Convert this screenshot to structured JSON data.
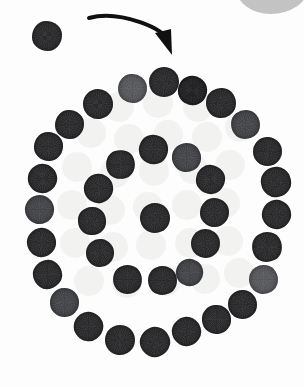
{
  "scene": {
    "title": "Spiral arrangement of dark discs",
    "width": 304,
    "height": 387,
    "background_color": "#fdfdfd",
    "surface_pattern_color": "#f2f2f1"
  },
  "annotation": {
    "arrow": {
      "name": "curved-direction-arrow",
      "color": "#101010",
      "start_x": 89,
      "start_y": 18,
      "end_x": 172,
      "end_y": 55,
      "stroke_width": 4,
      "curve": "clockwise-arc-right-down"
    }
  },
  "corner_blob": {
    "name": "grey-corner-shape",
    "color": "#b9b9b9",
    "x": 236,
    "y": -16,
    "width": 72,
    "height": 30
  },
  "legend": {
    "disc_dark_color": "#232326",
    "disc_base_color": "#2c2c2e",
    "disc_mid_color": "#46474b",
    "disc_light_color": "#5a5b5f"
  },
  "counts": {
    "outer_ring": 26,
    "inner_ring": 13,
    "center": 1,
    "stray": 1,
    "total_discs": 41,
    "background_dots": 28
  },
  "background_dots": [
    {
      "x": 104,
      "y": 92,
      "d": 30
    },
    {
      "x": 143,
      "y": 88,
      "d": 30
    },
    {
      "x": 183,
      "y": 92,
      "d": 30
    },
    {
      "x": 76,
      "y": 118,
      "d": 30
    },
    {
      "x": 114,
      "y": 124,
      "d": 30
    },
    {
      "x": 153,
      "y": 120,
      "d": 30
    },
    {
      "x": 192,
      "y": 122,
      "d": 30
    },
    {
      "x": 225,
      "y": 112,
      "d": 30
    },
    {
      "x": 62,
      "y": 152,
      "d": 30
    },
    {
      "x": 100,
      "y": 158,
      "d": 30
    },
    {
      "x": 139,
      "y": 156,
      "d": 30
    },
    {
      "x": 178,
      "y": 154,
      "d": 30
    },
    {
      "x": 215,
      "y": 150,
      "d": 30
    },
    {
      "x": 57,
      "y": 190,
      "d": 30
    },
    {
      "x": 95,
      "y": 195,
      "d": 30
    },
    {
      "x": 133,
      "y": 192,
      "d": 30
    },
    {
      "x": 172,
      "y": 190,
      "d": 30
    },
    {
      "x": 210,
      "y": 188,
      "d": 30
    },
    {
      "x": 60,
      "y": 228,
      "d": 30
    },
    {
      "x": 98,
      "y": 232,
      "d": 30
    },
    {
      "x": 136,
      "y": 230,
      "d": 30
    },
    {
      "x": 175,
      "y": 228,
      "d": 30
    },
    {
      "x": 213,
      "y": 226,
      "d": 30
    },
    {
      "x": 74,
      "y": 266,
      "d": 30
    },
    {
      "x": 112,
      "y": 268,
      "d": 30
    },
    {
      "x": 151,
      "y": 266,
      "d": 30
    },
    {
      "x": 190,
      "y": 264,
      "d": 30
    },
    {
      "x": 224,
      "y": 258,
      "d": 30
    }
  ],
  "discs": [
    {
      "x": 32,
      "y": 21,
      "d": 30,
      "tone": "base",
      "group": "stray"
    },
    {
      "x": 118,
      "y": 74,
      "d": 29,
      "tone": "light",
      "group": "outer"
    },
    {
      "x": 149,
      "y": 67,
      "d": 30,
      "tone": "base",
      "group": "outer"
    },
    {
      "x": 178,
      "y": 76,
      "d": 29,
      "tone": "dark",
      "group": "outer"
    },
    {
      "x": 206,
      "y": 88,
      "d": 30,
      "tone": "base",
      "group": "outer"
    },
    {
      "x": 231,
      "y": 110,
      "d": 29,
      "tone": "mid",
      "group": "outer"
    },
    {
      "x": 253,
      "y": 137,
      "d": 29,
      "tone": "base",
      "group": "outer"
    },
    {
      "x": 261,
      "y": 167,
      "d": 30,
      "tone": "base",
      "group": "outer"
    },
    {
      "x": 262,
      "y": 200,
      "d": 29,
      "tone": "base",
      "group": "outer"
    },
    {
      "x": 252,
      "y": 232,
      "d": 30,
      "tone": "base",
      "group": "outer"
    },
    {
      "x": 249,
      "y": 265,
      "d": 29,
      "tone": "light",
      "group": "outer"
    },
    {
      "x": 228,
      "y": 290,
      "d": 29,
      "tone": "base",
      "group": "outer"
    },
    {
      "x": 202,
      "y": 305,
      "d": 29,
      "tone": "base",
      "group": "outer"
    },
    {
      "x": 172,
      "y": 317,
      "d": 29,
      "tone": "base",
      "group": "outer"
    },
    {
      "x": 140,
      "y": 327,
      "d": 30,
      "tone": "base",
      "group": "outer"
    },
    {
      "x": 105,
      "y": 325,
      "d": 30,
      "tone": "base",
      "group": "outer"
    },
    {
      "x": 74,
      "y": 312,
      "d": 29,
      "tone": "base",
      "group": "outer"
    },
    {
      "x": 50,
      "y": 288,
      "d": 29,
      "tone": "mid",
      "group": "outer"
    },
    {
      "x": 33,
      "y": 260,
      "d": 29,
      "tone": "base",
      "group": "outer"
    },
    {
      "x": 27,
      "y": 228,
      "d": 29,
      "tone": "base",
      "group": "outer"
    },
    {
      "x": 25,
      "y": 195,
      "d": 29,
      "tone": "mid",
      "group": "outer"
    },
    {
      "x": 28,
      "y": 164,
      "d": 29,
      "tone": "base",
      "group": "outer"
    },
    {
      "x": 34,
      "y": 132,
      "d": 29,
      "tone": "base",
      "group": "outer"
    },
    {
      "x": 55,
      "y": 110,
      "d": 29,
      "tone": "base",
      "group": "outer"
    },
    {
      "x": 83,
      "y": 89,
      "d": 30,
      "tone": "base",
      "group": "outer"
    },
    {
      "x": 139,
      "y": 135,
      "d": 29,
      "tone": "base",
      "group": "inner"
    },
    {
      "x": 172,
      "y": 143,
      "d": 29,
      "tone": "mid",
      "group": "inner"
    },
    {
      "x": 196,
      "y": 165,
      "d": 29,
      "tone": "base",
      "group": "inner"
    },
    {
      "x": 200,
      "y": 198,
      "d": 29,
      "tone": "base",
      "group": "inner"
    },
    {
      "x": 191,
      "y": 229,
      "d": 29,
      "tone": "base",
      "group": "inner"
    },
    {
      "x": 176,
      "y": 259,
      "d": 27,
      "tone": "mid",
      "group": "inner"
    },
    {
      "x": 148,
      "y": 266,
      "d": 29,
      "tone": "base",
      "group": "inner"
    },
    {
      "x": 113,
      "y": 265,
      "d": 29,
      "tone": "base",
      "group": "inner"
    },
    {
      "x": 86,
      "y": 239,
      "d": 28,
      "tone": "base",
      "group": "inner"
    },
    {
      "x": 78,
      "y": 207,
      "d": 28,
      "tone": "base",
      "group": "inner"
    },
    {
      "x": 84,
      "y": 174,
      "d": 29,
      "tone": "base",
      "group": "inner"
    },
    {
      "x": 106,
      "y": 150,
      "d": 29,
      "tone": "base",
      "group": "inner"
    },
    {
      "x": 140,
      "y": 203,
      "d": 30,
      "tone": "base",
      "group": "center"
    }
  ]
}
